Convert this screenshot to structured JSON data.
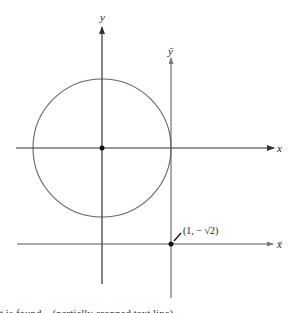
{
  "diagram": {
    "axes": {
      "x": {
        "label": "x"
      },
      "y": {
        "label": "y"
      },
      "x_bar": {
        "label": "x̄"
      },
      "y_bar": {
        "label": "ȳ"
      }
    },
    "point": {
      "label": "(1, − √2)"
    },
    "colors": {
      "stroke": "#333333",
      "circle": "#666666",
      "background": "#ffffff"
    },
    "footer_text": "t is found... (partially cropped text line)"
  }
}
